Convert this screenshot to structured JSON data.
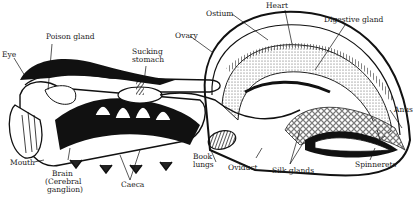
{
  "diagram": {
    "labels": {
      "eye": "Eye",
      "poison_gland": "Poison gland",
      "sucking_stomach_1": "Sucking",
      "sucking_stomach_2": "stomach",
      "ovary": "Ovary",
      "ostium": "Ostium",
      "heart": "Heart",
      "digestive_gland": "Digestive gland",
      "anus": "Anus",
      "mouth": "Mouth",
      "brain_1": "Brain",
      "brain_2": "(Cerebral",
      "brain_3": "ganglion)",
      "caeca": "Caeca",
      "book_lungs_1": "Book",
      "book_lungs_2": "lungs",
      "oviduct": "Oviduct",
      "silk_glands": "Silk glands",
      "spinnerets": "Spinnerets"
    },
    "colors": {
      "ink": "#1a1a1a",
      "paper": "#ffffff"
    }
  }
}
